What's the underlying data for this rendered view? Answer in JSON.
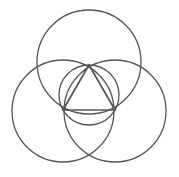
{
  "diagram": {
    "background": "#ffffff",
    "stroke_color": "#555555",
    "stroke_width": 1.3,
    "circles": [
      {
        "name": "top-circle",
        "cx": 89,
        "cy": 62,
        "r": 52
      },
      {
        "name": "left-circle",
        "cx": 63,
        "cy": 111,
        "r": 51
      },
      {
        "name": "right-circle",
        "cx": 115,
        "cy": 111,
        "r": 51
      },
      {
        "name": "inscribed-circle",
        "cx": 89,
        "cy": 95,
        "r": 30
      }
    ],
    "triangle": {
      "points": [
        [
          89,
          65
        ],
        [
          63,
          110
        ],
        [
          115,
          110
        ]
      ]
    }
  }
}
